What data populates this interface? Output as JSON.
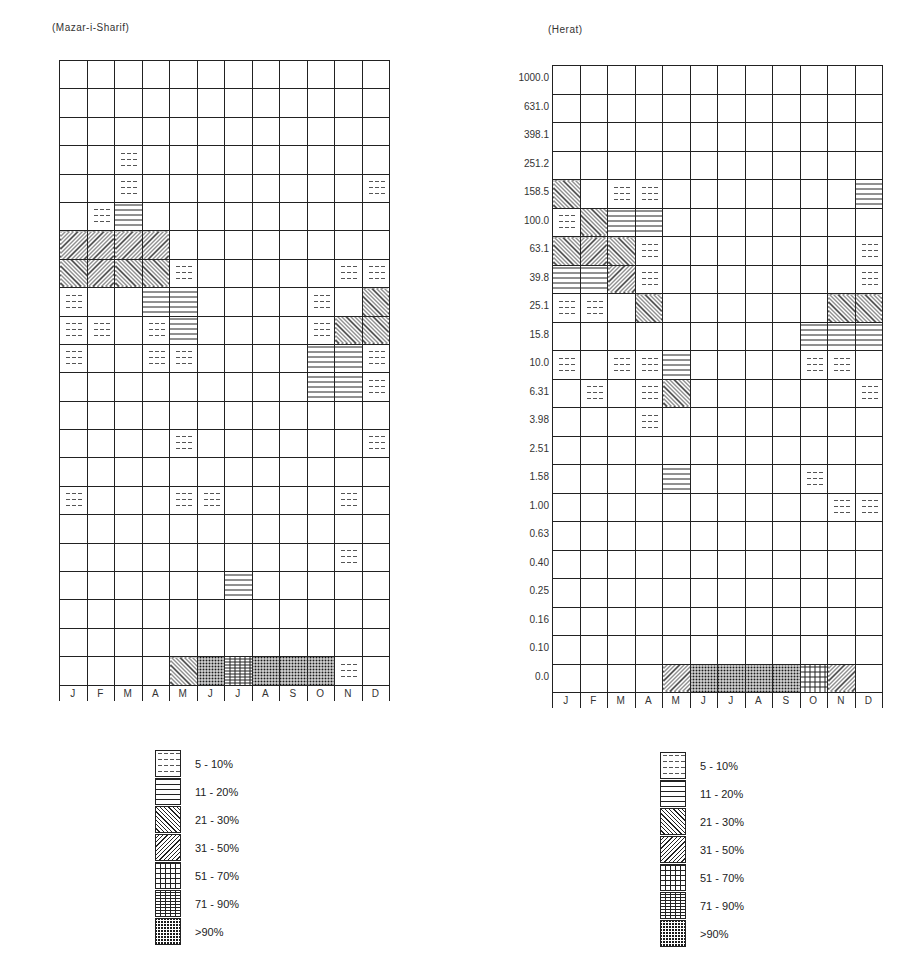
{
  "chart_data": [
    {
      "type": "heatmap",
      "title": "(Mazar-i-Sharif)",
      "xlabel": "",
      "ylabel": "",
      "categories": [
        "J",
        "F",
        "M",
        "A",
        "M",
        "J",
        "J",
        "A",
        "S",
        "O",
        "N",
        "D"
      ],
      "y_ticks": [
        "1000.0",
        "631.0",
        "398.1",
        "251.2",
        "158.5",
        "100.0",
        "63.1",
        "39.8",
        "25.1",
        "15.8",
        "10.0",
        "6.31",
        "3.98",
        "2.51",
        "1.58",
        "1.00",
        "0.63",
        "0.40",
        "0.25",
        "0.16",
        "0.10",
        "0.0"
      ],
      "value_encoding": "0 = blank, 1 = 5-10%, 2 = 11-20%, 3 = 21-30%, 4 = 31-50%, 5 = 51-70%, 6 = 71-90%, 7 = >90%",
      "grid": [
        [
          0,
          0,
          0,
          0,
          0,
          0,
          0,
          0,
          0,
          0,
          0,
          0
        ],
        [
          0,
          0,
          0,
          0,
          0,
          0,
          0,
          0,
          0,
          0,
          0,
          0
        ],
        [
          0,
          0,
          0,
          0,
          0,
          0,
          0,
          0,
          0,
          0,
          0,
          0
        ],
        [
          0,
          0,
          1,
          0,
          0,
          0,
          0,
          0,
          0,
          0,
          0,
          0
        ],
        [
          0,
          0,
          1,
          0,
          0,
          0,
          0,
          0,
          0,
          0,
          0,
          1
        ],
        [
          0,
          1,
          2,
          0,
          0,
          0,
          0,
          0,
          0,
          0,
          0,
          0
        ],
        [
          4,
          4,
          4,
          4,
          0,
          0,
          0,
          0,
          0,
          0,
          0,
          0
        ],
        [
          3,
          4,
          3,
          3,
          1,
          0,
          0,
          0,
          0,
          0,
          1,
          1
        ],
        [
          1,
          0,
          0,
          2,
          2,
          0,
          0,
          0,
          0,
          1,
          0,
          3
        ],
        [
          1,
          1,
          0,
          1,
          2,
          0,
          0,
          0,
          0,
          1,
          3,
          3
        ],
        [
          1,
          0,
          0,
          1,
          1,
          0,
          0,
          0,
          0,
          2,
          2,
          1
        ],
        [
          0,
          0,
          0,
          0,
          0,
          0,
          0,
          0,
          0,
          2,
          2,
          1
        ],
        [
          0,
          0,
          0,
          0,
          0,
          0,
          0,
          0,
          0,
          0,
          0,
          0
        ],
        [
          0,
          0,
          0,
          0,
          1,
          0,
          0,
          0,
          0,
          0,
          0,
          1
        ],
        [
          0,
          0,
          0,
          0,
          0,
          0,
          0,
          0,
          0,
          0,
          0,
          0
        ],
        [
          1,
          0,
          0,
          0,
          1,
          1,
          0,
          0,
          0,
          0,
          1,
          0
        ],
        [
          0,
          0,
          0,
          0,
          0,
          0,
          0,
          0,
          0,
          0,
          0,
          0
        ],
        [
          0,
          0,
          0,
          0,
          0,
          0,
          0,
          0,
          0,
          0,
          1,
          0
        ],
        [
          0,
          0,
          0,
          0,
          0,
          0,
          2,
          0,
          0,
          0,
          0,
          0
        ],
        [
          0,
          0,
          0,
          0,
          0,
          0,
          0,
          0,
          0,
          0,
          0,
          0
        ],
        [
          0,
          0,
          0,
          0,
          0,
          0,
          0,
          0,
          0,
          0,
          0,
          0
        ],
        [
          0,
          0,
          0,
          0,
          3,
          7,
          6,
          7,
          7,
          7,
          1,
          0
        ]
      ],
      "legend": [
        "5 - 10%",
        "11 - 20%",
        "21 - 30%",
        "31 - 50%",
        "51 - 70%",
        "71 - 90%",
        ">90%"
      ]
    },
    {
      "type": "heatmap",
      "title": "(Herat)",
      "xlabel": "",
      "ylabel": "",
      "categories": [
        "J",
        "F",
        "M",
        "A",
        "M",
        "J",
        "J",
        "A",
        "S",
        "O",
        "N",
        "D"
      ],
      "y_ticks": [
        "1000.0",
        "631.0",
        "398.1",
        "251.2",
        "158.5",
        "100.0",
        "63.1",
        "39.8",
        "25.1",
        "15.8",
        "10.0",
        "6.31",
        "3.98",
        "2.51",
        "1.58",
        "1.00",
        "0.63",
        "0.40",
        "0.25",
        "0.16",
        "0.10",
        "0.0"
      ],
      "value_encoding": "0 = blank, 1 = 5-10%, 2 = 11-20%, 3 = 21-30%, 4 = 31-50%, 5 = 51-70%, 6 = 71-90%, 7 = >90%",
      "grid": [
        [
          0,
          0,
          0,
          0,
          0,
          0,
          0,
          0,
          0,
          0,
          0,
          0
        ],
        [
          0,
          0,
          0,
          0,
          0,
          0,
          0,
          0,
          0,
          0,
          0,
          0
        ],
        [
          0,
          0,
          0,
          0,
          0,
          0,
          0,
          0,
          0,
          0,
          0,
          0
        ],
        [
          0,
          0,
          0,
          0,
          0,
          0,
          0,
          0,
          0,
          0,
          0,
          0
        ],
        [
          3,
          0,
          1,
          1,
          0,
          0,
          0,
          0,
          0,
          0,
          0,
          2
        ],
        [
          1,
          3,
          2,
          2,
          0,
          0,
          0,
          0,
          0,
          0,
          0,
          0
        ],
        [
          3,
          4,
          3,
          1,
          0,
          0,
          0,
          0,
          0,
          0,
          0,
          1
        ],
        [
          2,
          2,
          4,
          1,
          0,
          0,
          0,
          0,
          0,
          0,
          0,
          1
        ],
        [
          1,
          1,
          0,
          3,
          0,
          0,
          0,
          0,
          0,
          0,
          3,
          3
        ],
        [
          0,
          0,
          0,
          0,
          0,
          0,
          0,
          0,
          0,
          2,
          2,
          2
        ],
        [
          1,
          0,
          1,
          1,
          2,
          0,
          0,
          0,
          0,
          1,
          1,
          0
        ],
        [
          0,
          1,
          0,
          1,
          3,
          0,
          0,
          0,
          0,
          0,
          0,
          1
        ],
        [
          0,
          0,
          0,
          1,
          0,
          0,
          0,
          0,
          0,
          0,
          0,
          0
        ],
        [
          0,
          0,
          0,
          0,
          0,
          0,
          0,
          0,
          0,
          0,
          0,
          0
        ],
        [
          0,
          0,
          0,
          0,
          2,
          0,
          0,
          0,
          0,
          1,
          0,
          0
        ],
        [
          0,
          0,
          0,
          0,
          0,
          0,
          0,
          0,
          0,
          0,
          1,
          1
        ],
        [
          0,
          0,
          0,
          0,
          0,
          0,
          0,
          0,
          0,
          0,
          0,
          0
        ],
        [
          0,
          0,
          0,
          0,
          0,
          0,
          0,
          0,
          0,
          0,
          0,
          0
        ],
        [
          0,
          0,
          0,
          0,
          0,
          0,
          0,
          0,
          0,
          0,
          0,
          0
        ],
        [
          0,
          0,
          0,
          0,
          0,
          0,
          0,
          0,
          0,
          0,
          0,
          0
        ],
        [
          0,
          0,
          0,
          0,
          0,
          0,
          0,
          0,
          0,
          0,
          0,
          0
        ],
        [
          0,
          0,
          0,
          0,
          4,
          7,
          7,
          7,
          7,
          5,
          4,
          0
        ]
      ],
      "legend": [
        "5 - 10%",
        "11 - 20%",
        "21 - 30%",
        "31 - 50%",
        "51 - 70%",
        "71 - 90%",
        ">90%"
      ]
    }
  ],
  "panels": [
    {
      "title": "(Mazar-i-Sharif)",
      "y_labels": [
        "1000.0",
        "631.0",
        "398.1",
        "251.2",
        "158.5",
        "100.0",
        "63.1",
        "39.8",
        "25.1",
        "15.8",
        "10.0",
        "6.31",
        "3.98",
        "2.51",
        "1.58",
        "1.00",
        "0.63",
        "0.40",
        "0.25",
        "0.16",
        "0.10",
        "0.0"
      ],
      "x_labels": [
        "J",
        "F",
        "M",
        "A",
        "M",
        "J",
        "J",
        "A",
        "S",
        "O",
        "N",
        "D"
      ]
    },
    {
      "title": "(Herat)",
      "y_labels": [
        "1000.0",
        "631.0",
        "398.1",
        "251.2",
        "158.5",
        "100.0",
        "63.1",
        "39.8",
        "25.1",
        "15.8",
        "10.0",
        "6.31",
        "3.98",
        "2.51",
        "1.58",
        "1.00",
        "0.63",
        "0.40",
        "0.25",
        "0.16",
        "0.10",
        "0.0"
      ],
      "x_labels": [
        "J",
        "F",
        "M",
        "A",
        "M",
        "J",
        "J",
        "A",
        "S",
        "O",
        "N",
        "D"
      ]
    }
  ],
  "legends": [
    {
      "items": [
        "5 - 10%",
        "11 - 20%",
        "21 - 30%",
        "31 - 50%",
        "51 - 70%",
        "71 - 90%",
        ">90%"
      ]
    },
    {
      "items": [
        "5 - 10%",
        "11 - 20%",
        "21 - 30%",
        "31 - 50%",
        "51 - 70%",
        "71 - 90%",
        ">90%"
      ]
    }
  ]
}
